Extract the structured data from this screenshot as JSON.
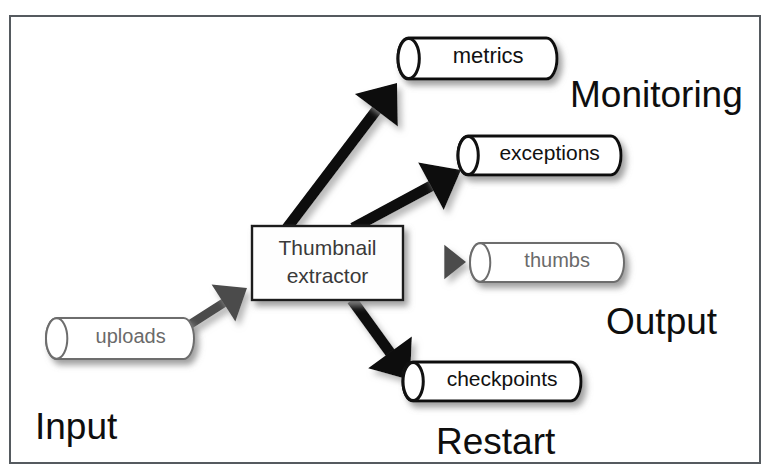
{
  "diagram": {
    "frame": {
      "border_color": "#555a5f",
      "background": "#ffffff"
    },
    "process": {
      "name": "thumbnail-extractor",
      "line1": "Thumbnail",
      "line2": "extractor",
      "x": 252,
      "y": 226,
      "w": 151,
      "h": 74,
      "stroke": "#1a1a1a",
      "fill": "#fefefe",
      "text_color": "#3a3a3a"
    },
    "stores": [
      {
        "id": "metrics",
        "label": "metrics",
        "x": 398,
        "y": 38,
        "w": 159,
        "h": 41,
        "stroke": "#111111",
        "stroke_width": 3,
        "fill": "#ffffff",
        "text_color": "#111111",
        "font_size": 22,
        "emphasis": "strong"
      },
      {
        "id": "exceptions",
        "label": "exceptions",
        "x": 458,
        "y": 136,
        "w": 163,
        "h": 39,
        "stroke": "#111111",
        "stroke_width": 3,
        "fill": "#ffffff",
        "text_color": "#111111",
        "font_size": 21,
        "emphasis": "strong"
      },
      {
        "id": "thumbs",
        "label": "thumbs",
        "x": 470,
        "y": 243,
        "w": 154,
        "h": 39,
        "stroke": "#6d6d6d",
        "stroke_width": 2,
        "fill": "#ffffff",
        "text_color": "#6a6a6a",
        "font_size": 20,
        "emphasis": "light"
      },
      {
        "id": "checkpoints",
        "label": "checkpoints",
        "x": 403,
        "y": 362,
        "w": 178,
        "h": 39,
        "stroke": "#111111",
        "stroke_width": 3,
        "fill": "#ffffff",
        "text_color": "#111111",
        "font_size": 21,
        "emphasis": "strong"
      },
      {
        "id": "uploads",
        "label": "uploads",
        "x": 46,
        "y": 318,
        "w": 148,
        "h": 41,
        "stroke": "#6d6d6d",
        "stroke_width": 2,
        "fill": "#ffffff",
        "text_color": "#6a6a6a",
        "font_size": 20,
        "emphasis": "light"
      }
    ],
    "arrows": [
      {
        "id": "uploads-to-extractor",
        "from": "uploads",
        "to": "thumbnail-extractor",
        "color": "#4b4b4b",
        "width": 9,
        "x1": 186,
        "y1": 327,
        "x2": 247,
        "y2": 288
      },
      {
        "id": "extractor-to-metrics",
        "from": "thumbnail-extractor",
        "to": "metrics",
        "color": "#0d0d0d",
        "width": 11,
        "x1": 287,
        "y1": 228,
        "x2": 397,
        "y2": 83
      },
      {
        "id": "extractor-to-exceptions",
        "from": "thumbnail-extractor",
        "to": "exceptions",
        "color": "#0d0d0d",
        "width": 11,
        "x1": 353,
        "y1": 228,
        "x2": 461,
        "y2": 170
      },
      {
        "id": "extractor-to-thumbs",
        "from": "thumbnail-extractor",
        "to": "thumbs",
        "color": "#4b4b4b",
        "width": 7,
        "x1": 404,
        "y1": 262,
        "x2": 466,
        "y2": 262
      },
      {
        "id": "extractor-to-checkpoints",
        "from": "thumbnail-extractor",
        "to": "checkpoints",
        "color": "#0d0d0d",
        "width": 11,
        "x1": 352,
        "y1": 300,
        "x2": 410,
        "y2": 380
      }
    ],
    "corner_labels": [
      {
        "id": "monitoring",
        "text": "Monitoring",
        "x": 570,
        "y": 76,
        "font_size": 37
      },
      {
        "id": "output",
        "text": "Output",
        "x": 606,
        "y": 303,
        "font_size": 37
      },
      {
        "id": "input",
        "text": "Input",
        "x": 35,
        "y": 408,
        "font_size": 37
      },
      {
        "id": "restart",
        "text": "Restart",
        "x": 436,
        "y": 423,
        "font_size": 37
      }
    ]
  }
}
